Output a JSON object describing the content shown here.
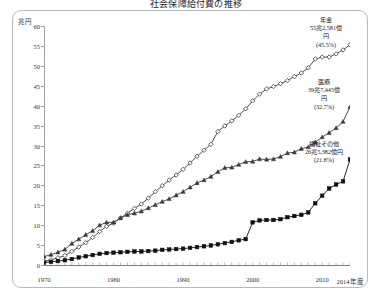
{
  "title": "社会保障給付費の推移",
  "axes": {
    "y_unit": "兆円",
    "y_ticks": [
      "60",
      "55",
      "50",
      "45",
      "40",
      "35",
      "30",
      "25",
      "20",
      "15",
      "10",
      "5",
      "0"
    ],
    "x_ticks": [
      "1970",
      "1980",
      "1990",
      "2000",
      "2010",
      "2014年度"
    ]
  },
  "annotations": {
    "pension": {
      "name": "年金",
      "amount": "55兆2,581億",
      "unit": "円",
      "share": "(45.5%)"
    },
    "medical": {
      "name": "医療",
      "amount": "39兆7,445億",
      "unit": "円",
      "share": "(32.7%)"
    },
    "welfare": {
      "name": "福祉その他",
      "amount": "26兆5,382億円",
      "share": "(21.8%)"
    }
  },
  "colors": {
    "pension": "#3b3b3b",
    "medical": "#3b3b3b",
    "welfare": "#111111",
    "axis": "#8f8f8f",
    "frame": "#b9b9b9"
  },
  "chart_data": {
    "type": "line",
    "title": "社会保障給付費の推移",
    "xlabel": "",
    "ylabel": "兆円",
    "ylim": [
      0,
      60
    ],
    "xlim": [
      1970,
      2014
    ],
    "grid": false,
    "legend_position": "inline-annotations",
    "x": [
      1970,
      1971,
      1972,
      1973,
      1974,
      1975,
      1976,
      1977,
      1978,
      1979,
      1980,
      1981,
      1982,
      1983,
      1984,
      1985,
      1986,
      1987,
      1988,
      1989,
      1990,
      1991,
      1992,
      1993,
      1994,
      1995,
      1996,
      1997,
      1998,
      1999,
      2000,
      2001,
      2002,
      2003,
      2004,
      2005,
      2006,
      2007,
      2008,
      2009,
      2010,
      2011,
      2012,
      2013,
      2014
    ],
    "series": [
      {
        "name": "年金",
        "marker": "diamond",
        "values": [
          0.9,
          1.3,
          1.8,
          2.4,
          3.4,
          4.5,
          5.6,
          6.9,
          8.4,
          9.7,
          10.5,
          11.8,
          13.0,
          14.2,
          15.3,
          16.8,
          18.4,
          19.9,
          21.3,
          22.6,
          24.0,
          25.6,
          27.3,
          28.8,
          30.3,
          33.5,
          34.9,
          36.2,
          37.6,
          39.2,
          41.2,
          42.9,
          44.2,
          44.8,
          45.5,
          46.3,
          47.3,
          48.2,
          49.5,
          51.7,
          52.2,
          52.2,
          53.0,
          54.0,
          55.3
        ]
      },
      {
        "name": "医療",
        "marker": "triangle",
        "values": [
          2.1,
          2.6,
          3.2,
          3.9,
          5.4,
          6.5,
          7.6,
          8.6,
          10.0,
          10.7,
          10.7,
          11.8,
          12.6,
          13.0,
          13.5,
          14.3,
          15.1,
          15.9,
          16.6,
          17.5,
          18.4,
          19.5,
          20.6,
          21.3,
          22.2,
          23.4,
          24.4,
          24.5,
          25.2,
          25.9,
          26.0,
          26.6,
          26.5,
          26.6,
          27.2,
          28.1,
          28.3,
          29.2,
          29.6,
          30.8,
          32.1,
          33.2,
          34.4,
          36.0,
          39.7
        ]
      },
      {
        "name": "福祉その他",
        "marker": "square",
        "values": [
          0.6,
          0.8,
          1.0,
          1.2,
          1.5,
          1.9,
          2.2,
          2.5,
          2.8,
          3.0,
          3.1,
          3.2,
          3.3,
          3.4,
          3.4,
          3.5,
          3.6,
          3.8,
          3.9,
          4.0,
          4.1,
          4.3,
          4.5,
          4.7,
          4.9,
          5.2,
          5.5,
          5.8,
          6.2,
          6.5,
          10.7,
          11.2,
          11.3,
          11.3,
          11.5,
          12.0,
          12.3,
          12.6,
          13.2,
          15.5,
          17.4,
          19.2,
          20.2,
          21.0,
          26.5
        ]
      }
    ]
  }
}
